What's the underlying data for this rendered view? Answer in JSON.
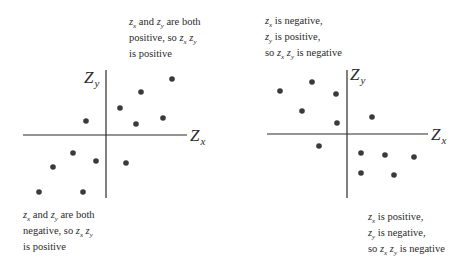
{
  "colors": {
    "ink": "#2a2a2a",
    "dot": "#3a3a3a",
    "background": "#ffffff"
  },
  "left_panel": {
    "axis_x_label": "Z",
    "axis_x_sub": "x",
    "axis_y_label": "Z",
    "axis_y_sub": "y",
    "caption_top": {
      "lines": [
        [
          "z",
          "x",
          " and ",
          "z",
          "y",
          " are both"
        ],
        [
          "positive, so ",
          "z",
          "x",
          " ",
          "z",
          "y"
        ],
        [
          "is positive"
        ]
      ]
    },
    "caption_bottom": {
      "lines": [
        [
          "z",
          "x",
          " and ",
          "z",
          "y",
          " are both"
        ],
        [
          "negative, so ",
          "z",
          "x",
          " ",
          "z",
          "y"
        ],
        [
          "is positive"
        ]
      ]
    },
    "axes": {
      "cx": 106,
      "cy": 135,
      "x_from": 23,
      "x_to": 187,
      "y_from": 70,
      "y_to": 198
    },
    "points": [
      [
        172,
        79
      ],
      [
        141,
        92
      ],
      [
        120,
        108
      ],
      [
        163,
        118
      ],
      [
        136,
        124
      ],
      [
        86,
        121
      ],
      [
        73,
        153
      ],
      [
        96,
        161
      ],
      [
        126,
        163
      ],
      [
        53,
        167
      ],
      [
        39,
        192
      ],
      [
        83,
        192
      ]
    ]
  },
  "right_panel": {
    "axis_x_label": "Z",
    "axis_x_sub": "x",
    "axis_y_label": "Z",
    "axis_y_sub": "y",
    "caption_top": {
      "lines": [
        [
          "z",
          "x",
          " is negative,"
        ],
        [
          "z",
          "y",
          " is positive,"
        ],
        [
          "so ",
          "z",
          "x",
          " ",
          "z",
          "y",
          " is  negative"
        ]
      ]
    },
    "caption_bottom": {
      "lines": [
        [
          "z",
          "x",
          " is positive,"
        ],
        [
          "z",
          "y",
          " is negative,"
        ],
        [
          "so ",
          "z",
          "x",
          " ",
          "z",
          "y",
          " is negative"
        ]
      ]
    },
    "axes": {
      "cx": 347,
      "cy": 134,
      "x_from": 267,
      "x_to": 428,
      "y_from": 70,
      "y_to": 198
    },
    "points": [
      [
        280,
        91
      ],
      [
        312,
        82
      ],
      [
        336,
        94
      ],
      [
        302,
        111
      ],
      [
        337,
        123
      ],
      [
        372,
        117
      ],
      [
        319,
        146
      ],
      [
        361,
        153
      ],
      [
        385,
        155
      ],
      [
        414,
        157
      ],
      [
        361,
        173
      ],
      [
        394,
        175
      ]
    ]
  },
  "chart_data": [
    {
      "type": "scatter",
      "title": "",
      "xlabel": "Z_x",
      "ylabel": "Z_y",
      "description": "Positive correlation: points lie in quadrants I and III",
      "annotations": [
        "z_x and z_y are both positive, so z_x z_y is positive",
        "z_x and z_y are both negative, so z_x z_y is positive"
      ],
      "x": [
        66,
        35,
        14,
        57,
        30,
        -20,
        -33,
        -10,
        20,
        -53,
        -67,
        -23
      ],
      "y": [
        56,
        43,
        27,
        17,
        11,
        14,
        -18,
        -26,
        -28,
        -32,
        -57,
        -57
      ],
      "grid": false
    },
    {
      "type": "scatter",
      "title": "",
      "xlabel": "Z_x",
      "ylabel": "Z_y",
      "description": "Negative correlation: points lie in quadrants II and IV",
      "annotations": [
        "z_x is negative, z_y is positive, so z_x z_y is negative",
        "z_x is positive, z_y is negative, so z_x z_y is negative"
      ],
      "x": [
        -67,
        -35,
        -11,
        -45,
        -10,
        25,
        -28,
        14,
        38,
        67,
        14,
        47
      ],
      "y": [
        43,
        52,
        40,
        23,
        11,
        17,
        -12,
        -19,
        -21,
        -23,
        -39,
        -41
      ],
      "grid": false
    }
  ]
}
